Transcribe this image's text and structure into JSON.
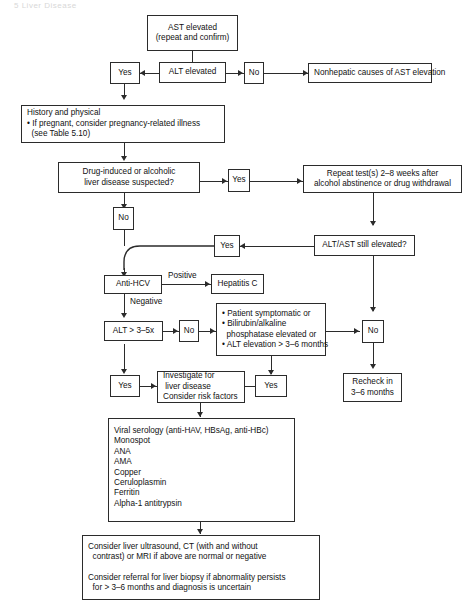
{
  "page": {
    "header_faint": "5  Liver Disease"
  },
  "flowchart": {
    "title": "Evaluation of elevated AST / ALT",
    "nodes": {
      "ast_elevated": {
        "line1": "AST elevated",
        "line2": "(repeat and confirm)"
      },
      "alt_elevated": {
        "line1": "ALT elevated"
      },
      "yes_alt": {
        "line1": "Yes"
      },
      "no_alt": {
        "line1": "No"
      },
      "nonhepatic": {
        "line1": "Nonhepatic causes of AST elevation"
      },
      "history": {
        "line1": "History and physical",
        "line2": "• If pregnant, consider pregnancy-related illness",
        "line3": "  (see Table 5.10)"
      },
      "drug_induced": {
        "line1": "Drug-induced or alcoholic",
        "line2": "liver disease suspected?"
      },
      "yes_drug": {
        "line1": "Yes"
      },
      "repeat_tests": {
        "line1": "Repeat test(s) 2–8 weeks after",
        "line2": "alcohol abstinence or drug withdrawal"
      },
      "no_drug": {
        "line1": "No"
      },
      "alt_ast_still": {
        "line1": "ALT/AST still elevated?"
      },
      "yes_still": {
        "line1": "Yes"
      },
      "no_still": {
        "line1": "No"
      },
      "recheck": {
        "line1": "Recheck in",
        "line2": "3–6 months"
      },
      "anti_hcv": {
        "line1": "Anti-HCV"
      },
      "hepatitis_c": {
        "line1": "Hepatitis C"
      },
      "alt_3_5x": {
        "line1": "ALT > 3–5x"
      },
      "no_alt35": {
        "line1": "No"
      },
      "criteria": {
        "line1": "• Patient symptomatic or",
        "line2": "• Bilirubin/alkaline",
        "line3": "  phosphatase elevated or",
        "line4": "• ALT elevation > 3–6 months"
      },
      "yes_alt35": {
        "line1": "Yes"
      },
      "yes_criteria": {
        "line1": "Yes"
      },
      "investigate": {
        "line1": "Investigate for",
        "line2": " liver disease",
        "line3": "Consider risk factors"
      },
      "serology": {
        "line1": "Viral serology (anti-HAV, HBsAg, anti-HBc)",
        "line2": "Monospot",
        "line3": "ANA",
        "line4": "AMA",
        "line5": "Copper",
        "line6": "Ceruloplasmin",
        "line7": "Ferritin",
        "line8": "Alpha-1 antitrypsin"
      },
      "imaging": {
        "line1": "Consider liver ultrasound, CT (with and without",
        "line2": "  contrast) or MRI if above are normal or negative",
        "line3": "",
        "line4": "Consider referral for liver biopsy if abnormality persists",
        "line5": "  for > 3–6 months and diagnosis is uncertain"
      }
    },
    "edge_labels": {
      "positive": "Positive",
      "negative": "Negative"
    },
    "colors": {
      "stroke": "#2b2b2b",
      "background": "#ffffff",
      "text": "#111111"
    }
  }
}
